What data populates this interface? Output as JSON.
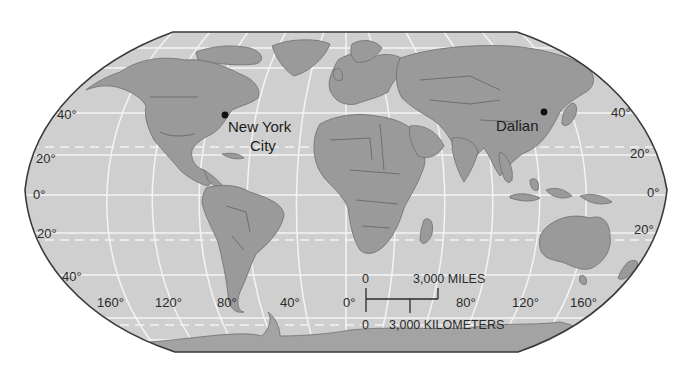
{
  "map": {
    "projection": "Robinson world map",
    "colors": {
      "ocean": "#cfcfcf",
      "land": "#9a9a9a",
      "land_dark": "#7d7d7d",
      "grid": "#f4f4f4",
      "outline": "#3a3a3a",
      "text": "#2a2a2a"
    },
    "cities": [
      {
        "name": "New York City",
        "line1": "New York",
        "line2": "City"
      },
      {
        "name": "Dalian",
        "line1": "Dalian"
      }
    ],
    "latitude_labels": {
      "left": [
        "40°",
        "20°",
        "0°",
        "20°",
        "40°"
      ],
      "right": [
        "40°",
        "20°",
        "0°",
        "20°"
      ]
    },
    "longitude_labels": [
      "160°",
      "120°",
      "80°",
      "40°",
      "0°",
      "80°",
      "120°",
      "160°"
    ],
    "scale_bar": {
      "miles_zero": "0",
      "miles_label": "3,000 MILES",
      "km_zero": "0",
      "km_label": "3,000 KILOMETERS"
    }
  }
}
